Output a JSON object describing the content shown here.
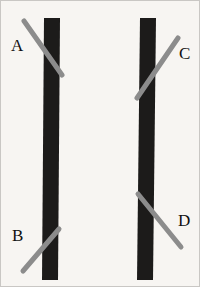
{
  "figure": {
    "name": "poggendorff-illusion",
    "canvas": {
      "width": 200,
      "height": 287,
      "background_color": "#f7f5f2",
      "border_color": "#c9c7c4"
    },
    "bars": [
      {
        "id": "left-bar",
        "label": "left vertical bar",
        "color": "#1c1b1a",
        "top_x": 43,
        "bottom_x": 41,
        "top_y": 17,
        "bottom_y": 279,
        "width": 16
      },
      {
        "id": "right-bar",
        "label": "right vertical bar",
        "color": "#1c1b1a",
        "top_x": 139,
        "bottom_x": 136,
        "top_y": 17,
        "bottom_y": 279,
        "width": 16
      }
    ],
    "oblique_lines": [
      {
        "id": "line-a",
        "label": "A",
        "color": "#8c8c8c",
        "stroke_width": 5,
        "x1": 23,
        "y1": 20,
        "x2": 61,
        "y2": 74,
        "side": "left-bar",
        "direction": "down-right"
      },
      {
        "id": "line-b",
        "label": "B",
        "color": "#8c8c8c",
        "stroke_width": 5,
        "x1": 22,
        "y1": 270,
        "x2": 58,
        "y2": 228,
        "side": "left-bar",
        "direction": "up-right"
      },
      {
        "id": "line-c",
        "label": "C",
        "color": "#8c8c8c",
        "stroke_width": 5,
        "x1": 136,
        "y1": 97,
        "x2": 177,
        "y2": 37,
        "side": "right-bar",
        "direction": "up-right"
      },
      {
        "id": "line-d",
        "label": "D",
        "color": "#8c8c8c",
        "stroke_width": 5,
        "x1": 137,
        "y1": 193,
        "x2": 180,
        "y2": 246,
        "side": "right-bar",
        "direction": "down-right"
      }
    ],
    "labels": [
      {
        "id": "label-a",
        "text": "A",
        "x": 10,
        "y": 50,
        "color": "#111111"
      },
      {
        "id": "label-b",
        "text": "B",
        "x": 11,
        "y": 240,
        "color": "#111111"
      },
      {
        "id": "label-c",
        "text": "C",
        "x": 178,
        "y": 58,
        "color": "#111111"
      },
      {
        "id": "label-d",
        "text": "D",
        "x": 177,
        "y": 225,
        "color": "#111111"
      }
    ]
  }
}
